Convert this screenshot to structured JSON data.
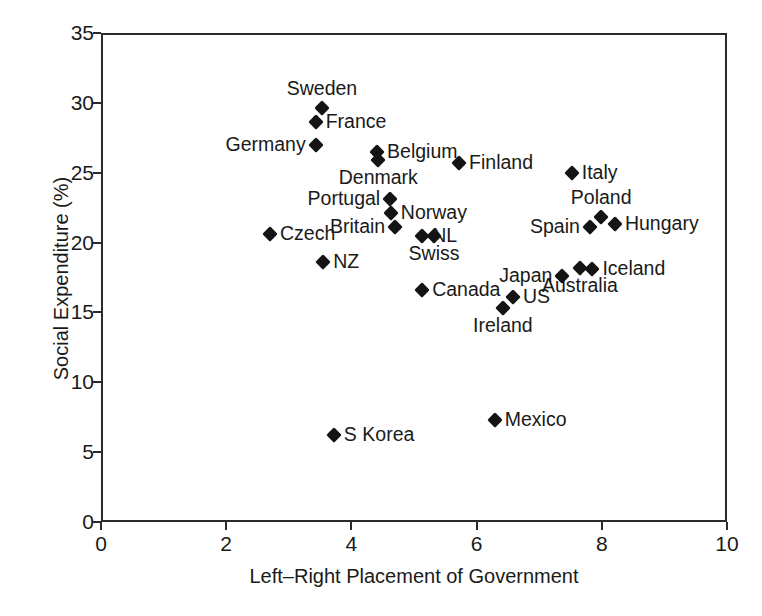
{
  "chart_data": {
    "type": "scatter",
    "title": "",
    "xlabel": "Left–Right Placement of Government",
    "ylabel": "Social Expenditure (%)",
    "xlim": [
      0,
      10
    ],
    "ylim": [
      0,
      35
    ],
    "xticks": [
      "0",
      "2",
      "4",
      "6",
      "8",
      "10"
    ],
    "yticks": [
      "0",
      "5",
      "10",
      "15",
      "20",
      "25",
      "30",
      "35"
    ],
    "grid": false,
    "legend": "none",
    "marker_color": "#141414",
    "axis_color": "#2b2b2b",
    "points": [
      {
        "name": "Sweden",
        "x": 3.53,
        "y": 29.6,
        "label_pos": "above"
      },
      {
        "name": "France",
        "x": 3.43,
        "y": 28.6,
        "label_pos": "right"
      },
      {
        "name": "Germany",
        "x": 3.43,
        "y": 27.0,
        "label_pos": "left"
      },
      {
        "name": "Belgium",
        "x": 4.41,
        "y": 26.5,
        "label_pos": "right"
      },
      {
        "name": "Denmark",
        "x": 4.43,
        "y": 25.9,
        "label_pos": "below"
      },
      {
        "name": "Finland",
        "x": 5.72,
        "y": 25.7,
        "label_pos": "right"
      },
      {
        "name": "Italy",
        "x": 7.52,
        "y": 25.0,
        "label_pos": "right"
      },
      {
        "name": "Portugal",
        "x": 4.62,
        "y": 23.1,
        "label_pos": "left"
      },
      {
        "name": "Norway",
        "x": 4.63,
        "y": 22.1,
        "label_pos": "right"
      },
      {
        "name": "Poland",
        "x": 7.99,
        "y": 21.8,
        "label_pos": "above"
      },
      {
        "name": "Hungary",
        "x": 8.21,
        "y": 21.3,
        "label_pos": "right"
      },
      {
        "name": "Spain",
        "x": 7.81,
        "y": 21.1,
        "label_pos": "left"
      },
      {
        "name": "Britain",
        "x": 4.7,
        "y": 21.1,
        "label_pos": "left"
      },
      {
        "name": "Czech",
        "x": 2.7,
        "y": 20.6,
        "label_pos": "right"
      },
      {
        "name": "NL",
        "x": 5.13,
        "y": 20.5,
        "label_pos": "right"
      },
      {
        "name": "Swiss",
        "x": 5.32,
        "y": 20.5,
        "label_pos": "below"
      },
      {
        "name": "NZ",
        "x": 3.55,
        "y": 18.6,
        "label_pos": "right"
      },
      {
        "name": "Iceland",
        "x": 7.85,
        "y": 18.1,
        "label_pos": "right"
      },
      {
        "name": "Australia",
        "x": 7.65,
        "y": 18.2,
        "label_pos": "below"
      },
      {
        "name": "Japan",
        "x": 7.37,
        "y": 17.6,
        "label_pos": "left"
      },
      {
        "name": "Canada",
        "x": 5.13,
        "y": 16.6,
        "label_pos": "right"
      },
      {
        "name": "US",
        "x": 6.58,
        "y": 16.1,
        "label_pos": "right"
      },
      {
        "name": "Ireland",
        "x": 6.42,
        "y": 15.3,
        "label_pos": "below"
      },
      {
        "name": "Mexico",
        "x": 6.29,
        "y": 7.3,
        "label_pos": "right"
      },
      {
        "name": "S Korea",
        "x": 3.72,
        "y": 6.2,
        "label_pos": "right"
      }
    ]
  }
}
